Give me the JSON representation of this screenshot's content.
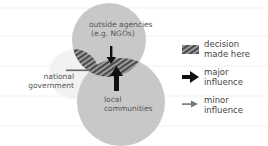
{
  "diagram": {
    "type": "venn",
    "circles": [
      {
        "id": "outside-agencies",
        "label_line1": "outside agencies",
        "label_line2": "(e.g. NGOs)",
        "color": "#c8c8c8"
      },
      {
        "id": "local-communities",
        "label_line1": "local",
        "label_line2": "communities",
        "color": "#c8c8c8"
      },
      {
        "id": "national-government",
        "label_line1": "national",
        "label_line2": "government",
        "color": "#f2f2f2"
      }
    ],
    "hatch_color": "#555555",
    "arrows": [
      {
        "from": "outside-agencies",
        "type": "major"
      },
      {
        "from": "local-communities",
        "type": "major"
      },
      {
        "from": "national-government",
        "type": "minor"
      }
    ]
  },
  "legend": {
    "items": [
      {
        "symbol": "hatched-box",
        "line1": "decision",
        "line2": "made here"
      },
      {
        "symbol": "major-arrow",
        "line1": "major",
        "line2": "influence"
      },
      {
        "symbol": "minor-arrow",
        "line1": "minor",
        "line2": "influence"
      }
    ]
  }
}
